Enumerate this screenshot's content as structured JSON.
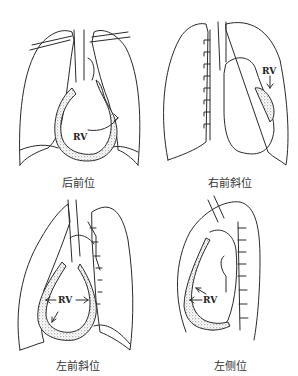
{
  "figure": {
    "panels": [
      {
        "id": "pa",
        "caption": "后前位",
        "rv_label": "RV"
      },
      {
        "id": "rao",
        "caption": "右前斜位",
        "rv_label": "RV"
      },
      {
        "id": "lao",
        "caption": "左前斜位",
        "rv_label": "RV"
      },
      {
        "id": "lat",
        "caption": "左侧位",
        "rv_label": "RV"
      }
    ],
    "colors": {
      "line": "#2a2a2a",
      "stipple": "#555555",
      "background": "#ffffff"
    }
  }
}
